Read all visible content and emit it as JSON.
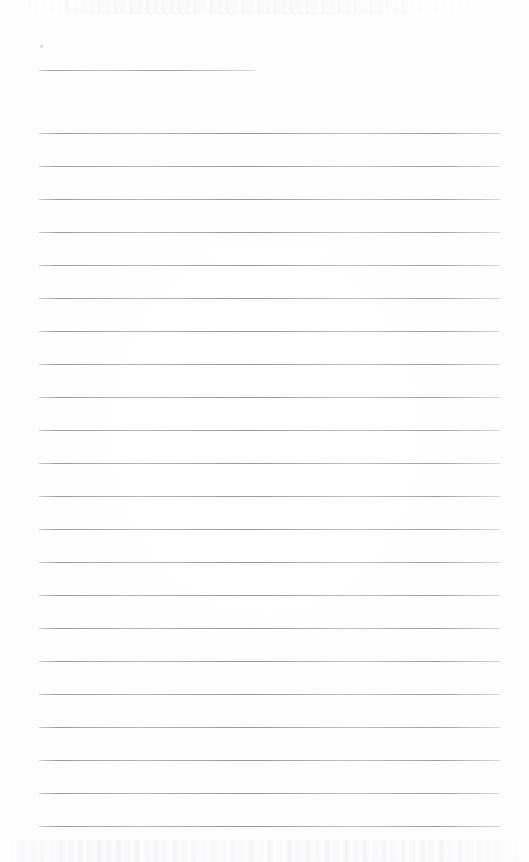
{
  "page": {
    "kind": "scanned-lined-notebook-page",
    "width": 529,
    "height": 862,
    "background_color": "#fefefe",
    "has_visible_text": false,
    "text_content": "",
    "note_label": ""
  },
  "ruling": {
    "line_color": "#969aa2",
    "line_thickness_px": 1,
    "line_left_px": 39,
    "line_right_px": 500,
    "line_spacing_px": 32.6,
    "total_line_count": 23
  },
  "header_rule": {
    "name": "title-rule",
    "y": 70,
    "left": 39,
    "right": 255,
    "width": 216
  },
  "body_rules": [
    {
      "index": 1,
      "y": 133
    },
    {
      "index": 2,
      "y": 166
    },
    {
      "index": 3,
      "y": 199
    },
    {
      "index": 4,
      "y": 232
    },
    {
      "index": 5,
      "y": 265
    },
    {
      "index": 6,
      "y": 298
    },
    {
      "index": 7,
      "y": 331
    },
    {
      "index": 8,
      "y": 364
    },
    {
      "index": 9,
      "y": 397
    },
    {
      "index": 10,
      "y": 430
    },
    {
      "index": 11,
      "y": 463
    },
    {
      "index": 12,
      "y": 496
    },
    {
      "index": 13,
      "y": 529
    },
    {
      "index": 14,
      "y": 562
    },
    {
      "index": 15,
      "y": 595
    },
    {
      "index": 16,
      "y": 628
    },
    {
      "index": 17,
      "y": 661
    },
    {
      "index": 18,
      "y": 694
    },
    {
      "index": 19,
      "y": 727
    },
    {
      "index": 20,
      "y": 760
    },
    {
      "index": 21,
      "y": 793
    },
    {
      "index": 22,
      "y": 826
    }
  ],
  "artifacts": {
    "speck": {
      "x": 40,
      "y": 45
    },
    "top_noise_band": {
      "y": 0,
      "height": 14
    },
    "bottom_noise_band": {
      "y": 840,
      "height": 22
    }
  }
}
